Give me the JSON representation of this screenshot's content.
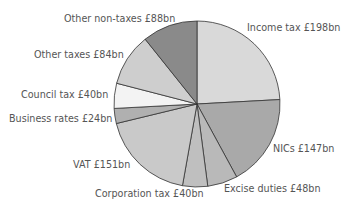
{
  "chart_data": {
    "type": "pie",
    "title": "",
    "unit": "£bn",
    "start": "top",
    "direction": "clockwise",
    "slices": [
      {
        "label": "Income tax £198bn",
        "name": "Income tax",
        "value": 198,
        "color": "#d9d9d9"
      },
      {
        "label": "NICs £147bn",
        "name": "NICs",
        "value": 147,
        "color": "#a9a9a9"
      },
      {
        "label": "Excise duties £48bn",
        "name": "Excise duties",
        "value": 48,
        "color": "#b9b9b9"
      },
      {
        "label": "Corporation tax £40bn",
        "name": "Corporation tax",
        "value": 40,
        "color": "#bfbfbf"
      },
      {
        "label": "VAT £151bn",
        "name": "VAT",
        "value": 151,
        "color": "#c9c9c9"
      },
      {
        "label": "Business rates £24bn",
        "name": "Business rates",
        "value": 24,
        "color": "#b0b0b0"
      },
      {
        "label": "Council tax £40bn",
        "name": "Council tax",
        "value": 40,
        "color": "#f3f3f3"
      },
      {
        "label": "Other taxes £84bn",
        "name": "Other taxes",
        "value": 84,
        "color": "#cecece"
      },
      {
        "label": "Other non-taxes £88bn",
        "name": "Other non-taxes",
        "value": 88,
        "color": "#8a8a8a"
      }
    ]
  }
}
